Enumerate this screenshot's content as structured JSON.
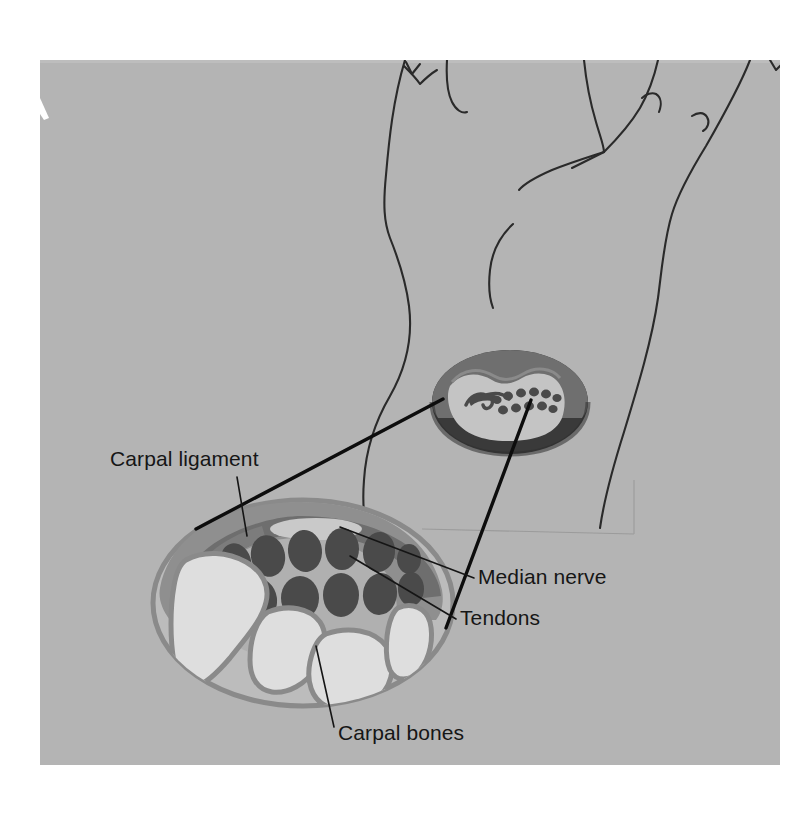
{
  "figure": {
    "canvas": {
      "width": 809,
      "height": 814,
      "background": "#ffffff"
    },
    "photo_panel": {
      "x": 40,
      "y": 60,
      "width": 740,
      "height": 705,
      "fill": "#b4b4b4",
      "notch_label": "white-edge-notch"
    }
  },
  "colors": {
    "page_background": "#ffffff",
    "photo_gray": "#b4b4b4",
    "tissue_fill": "#bcbcbc",
    "tissue_outline": "#8a8a8a",
    "ligament_dark": "#6e6e6e",
    "ligament_band": "#787878",
    "tendon_dark": "#4a4a4a",
    "bone_light": "#dcdcdc",
    "bone_outline": "#8a8a8a",
    "nerve_light": "#c9c9c9",
    "inset_rim_dark": "#3b3b3b",
    "inset_rim_mid": "#6e6e6e",
    "inset_interior": "#c2c2c2",
    "label_text": "#161616",
    "leader_line": "#151515",
    "magnification_line": "#0d0d0d",
    "hand_outline": "#2a2a2a",
    "surface_line": "#9b9b9b"
  },
  "labels": [
    {
      "id": "carpal-ligament",
      "text": "Carpal ligament",
      "x": 110,
      "y": 466,
      "anchor": "start",
      "leader": "from text baseline down-right to dark ligament band at (246,534)"
    },
    {
      "id": "median-nerve",
      "text": "Median nerve",
      "x": 478,
      "y": 584,
      "anchor": "start",
      "leader": "from text left edge up-left to pale oval at (340,527)"
    },
    {
      "id": "tendons",
      "text": "Tendons",
      "x": 460,
      "y": 625,
      "anchor": "start",
      "leader": "from text left edge up-left to dark ellipse at (352,556)"
    },
    {
      "id": "carpal-bones",
      "text": "Carpal bones",
      "x": 338,
      "y": 740,
      "anchor": "start",
      "leader": "from text up-left to pale bone shape at (318,648)"
    }
  ],
  "structures": {
    "hand_outline": {
      "name": "hand-and-forearm-outline",
      "description": "Thin black contour lines of a hand, fingers and wrist drawn above the cross-sections"
    },
    "inset_cross_section": {
      "name": "wrist-cross-section-inset",
      "center_x": 510,
      "center_y": 402,
      "radius_x": 78,
      "radius_y": 52,
      "tendon_dot_count_top_row": 6,
      "tendon_dot_count_bottom_row": 5,
      "has_median_nerve_hook": true
    },
    "main_cross_section": {
      "name": "carpal-tunnel-cross-section-main",
      "center_x": 303,
      "center_y": 603,
      "radius_x": 150,
      "radius_y": 103,
      "tendon_count_top_row": 6,
      "tendon_count_bottom_row": 5,
      "carpal_bone_count": 4,
      "has_carpal_ligament_band": true,
      "has_median_nerve_oval": true
    },
    "magnification_lines": {
      "name": "magnification-connector-lines",
      "count": 2,
      "left": {
        "x1": 443,
        "y1": 399,
        "x2": 196,
        "y2": 529
      },
      "right": {
        "x1": 531,
        "y1": 400,
        "x2": 446,
        "y2": 628
      }
    },
    "surface_line": {
      "name": "table-surface-line",
      "x1": 422,
      "y1": 529,
      "x2": 634,
      "y2": 534
    }
  }
}
